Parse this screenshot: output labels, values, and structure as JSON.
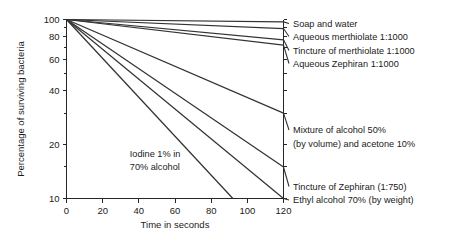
{
  "chart_data": {
    "type": "line",
    "title": "",
    "xlabel": "Time in seconds",
    "ylabel": "Percentage of surviving bacteria",
    "xlim": [
      0,
      120
    ],
    "ylim": [
      10,
      100
    ],
    "yscale": "log",
    "grid": false,
    "legend_position": "right-inline-labels",
    "xticks": [
      0,
      20,
      40,
      60,
      80,
      100,
      120
    ],
    "xtick_labels": [
      "0",
      "20",
      "40",
      "60",
      "80",
      "100",
      "120"
    ],
    "yticks": [
      100,
      80,
      60,
      40,
      20,
      10
    ],
    "ytick_labels": [
      "100",
      "80",
      "60",
      "40",
      "20",
      "10"
    ],
    "yticks_minor": [
      90,
      70,
      50,
      30,
      15
    ],
    "series": [
      {
        "name": "Soap and water",
        "label": "Soap and water",
        "x": [
          0,
          120
        ],
        "values": [
          100,
          97
        ]
      },
      {
        "name": "Aqueous merthiolate 1:1000",
        "label": "Aqueous merthiolate 1:1000",
        "x": [
          0,
          120
        ],
        "values": [
          100,
          89
        ]
      },
      {
        "name": "Tincture of merthiolate 1:1000",
        "label": "Tincture of merthiolate 1:1000",
        "x": [
          0,
          120
        ],
        "values": [
          100,
          77
        ]
      },
      {
        "name": "Aqueous Zephiran 1:1000",
        "label": "Aqueous Zephiran 1:1000",
        "x": [
          0,
          120
        ],
        "values": [
          100,
          72
        ]
      },
      {
        "name": "Mixture of alcohol 50% (by volume) and acetone 10%",
        "label_lines": [
          "Mixture of alcohol 50%",
          "(by volume) and acetone 10%"
        ],
        "x": [
          0,
          120
        ],
        "values": [
          100,
          30
        ]
      },
      {
        "name": "Tincture of Zephiran (1:750)",
        "label": "Tincture of Zephiran (1:750)",
        "x": [
          0,
          120
        ],
        "values": [
          100,
          15
        ]
      },
      {
        "name": "Ethyl alcohol 70% (by weight)",
        "label": "Ethyl alcohol 70% (by weight)",
        "x": [
          0,
          120
        ],
        "values": [
          100,
          10
        ]
      },
      {
        "name": "Iodine 1% in 70% alcohol",
        "label_lines": [
          "Iodine 1% in",
          "70% alcohol"
        ],
        "annotation_inside": true,
        "x": [
          0,
          92
        ],
        "values": [
          100,
          10
        ]
      }
    ],
    "annotations": [
      {
        "text_lines": [
          "Iodine 1% in",
          "70% alcohol"
        ],
        "x": 35,
        "y": 17
      }
    ]
  },
  "labels": {
    "soap_and_water": "Soap and water",
    "aqueous_merthiolate": "Aqueous merthiolate 1:1000",
    "tincture_merthiolate": "Tincture of merthiolate 1:1000",
    "aqueous_zephiran": "Aqueous Zephiran 1:1000",
    "mixture_alcohol_line1": "Mixture of alcohol 50%",
    "mixture_alcohol_line2": "(by volume) and acetone 10%",
    "tincture_zephiran": "Tincture of Zephiran (1:750)",
    "ethyl_alcohol": "Ethyl alcohol 70% (by weight)",
    "iodine_line1": "Iodine 1% in",
    "iodine_line2": "70% alcohol"
  },
  "axes": {
    "x_title": "Time in seconds",
    "y_title": "Percentage of surviving bacteria",
    "x_ticks": [
      "0",
      "20",
      "40",
      "60",
      "80",
      "100",
      "120"
    ],
    "y_ticks": [
      "100",
      "80",
      "60",
      "40",
      "20",
      "10"
    ]
  },
  "colors": {
    "background": "#ffffff",
    "line": "#333333",
    "axis": "#262626",
    "text": "#1a1a1a"
  }
}
